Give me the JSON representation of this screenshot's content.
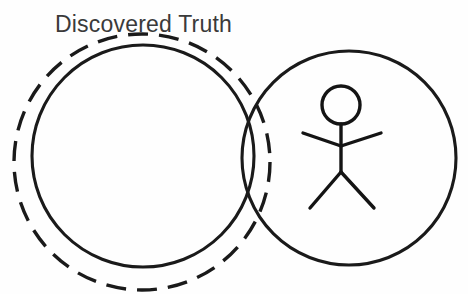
{
  "canvas": {
    "width": 468,
    "height": 294,
    "background_color": "#fefefe",
    "ink_color": "#1a1a1a",
    "text_color": "#3a3a3a"
  },
  "diagram": {
    "kind": "venn-style concept sketch",
    "label": {
      "text": "Discovered Truth",
      "x": 55,
      "y": 32,
      "font_size": 23
    },
    "shapes": {
      "dashed_circle": {
        "name": "total-truth-dashed-circle",
        "cx": 142,
        "cy": 162,
        "r": 128,
        "style": "dashed",
        "dash": "20 11",
        "stroke_width": 3.4
      },
      "left_circle": {
        "name": "discovered-truth-circle",
        "cx": 143,
        "cy": 156,
        "r": 111,
        "style": "solid",
        "stroke_width": 3.1
      },
      "right_circle": {
        "name": "person-circle",
        "cx": 349,
        "cy": 158,
        "r": 107,
        "style": "solid",
        "stroke_width": 3.1
      }
    },
    "stick_figure": {
      "name": "stick-figure",
      "head": {
        "cx": 341,
        "cy": 105,
        "r": 19
      },
      "spine": {
        "x1": 341,
        "y1": 124,
        "x2": 341,
        "y2": 172
      },
      "arm_left": {
        "x1": 303,
        "y1": 133,
        "x2": 341,
        "y2": 146
      },
      "arm_right": {
        "x1": 341,
        "y1": 146,
        "x2": 381,
        "y2": 133
      },
      "leg_left": {
        "x1": 341,
        "y1": 172,
        "x2": 310,
        "y2": 208
      },
      "leg_right": {
        "x1": 341,
        "y1": 172,
        "x2": 374,
        "y2": 208
      }
    }
  }
}
